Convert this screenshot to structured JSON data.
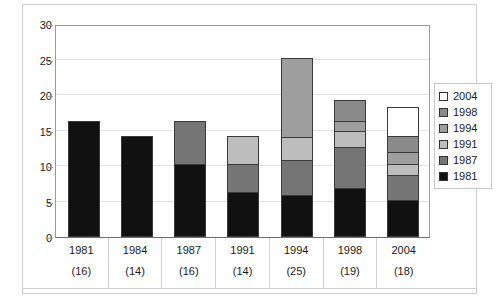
{
  "chart_data": {
    "type": "bar",
    "stacked": true,
    "title": "",
    "xlabel": "",
    "ylabel": "",
    "ylim": [
      0,
      30
    ],
    "yticks": [
      0,
      5,
      10,
      15,
      20,
      25,
      30
    ],
    "grid": true,
    "legend_position": "right",
    "categories": [
      "1981",
      "1984",
      "1987",
      "1991",
      "1994",
      "1998",
      "2004"
    ],
    "category_sublabels": [
      "(16)",
      "(14)",
      "(16)",
      "(14)",
      "(25)",
      "(19)",
      "(18)"
    ],
    "totals": [
      16,
      14,
      16,
      14,
      25,
      19,
      18
    ],
    "series": [
      {
        "name": "1981",
        "color": "#111111",
        "values": [
          16,
          14,
          10,
          6,
          5.7,
          6.6,
          5.0
        ]
      },
      {
        "name": "1987",
        "color": "#757575",
        "values": [
          0,
          0,
          6,
          4,
          4.8,
          5.8,
          3.5
        ]
      },
      {
        "name": "1991",
        "color": "#bdbdbd",
        "values": [
          0,
          0,
          0,
          4,
          3.3,
          2.3,
          1.5
        ]
      },
      {
        "name": "1994",
        "color": "#9e9e9e",
        "values": [
          0,
          0,
          0,
          0,
          11.2,
          1.3,
          1.7
        ]
      },
      {
        "name": "1998",
        "color": "#8a8a8a",
        "values": [
          0,
          0,
          0,
          0,
          0,
          3.0,
          2.3
        ]
      },
      {
        "name": "2004",
        "color": "#ffffff",
        "values": [
          0,
          0,
          0,
          0,
          0,
          0,
          4.0
        ]
      }
    ],
    "legend_entries": [
      {
        "label": "2004",
        "color": "#ffffff"
      },
      {
        "label": "1998",
        "color": "#8a8a8a"
      },
      {
        "label": "1994",
        "color": "#9e9e9e"
      },
      {
        "label": "1991",
        "color": "#bdbdbd"
      },
      {
        "label": "1987",
        "color": "#757575"
      },
      {
        "label": "1981",
        "color": "#111111"
      }
    ]
  }
}
